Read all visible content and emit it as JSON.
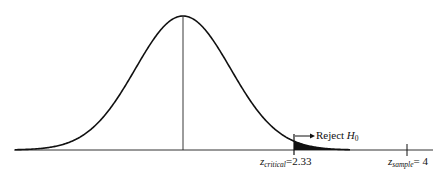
{
  "diagram": {
    "type": "normal-distribution-hypothesis-test",
    "labels": {
      "reject": "Reject",
      "reject_h": "H",
      "reject_h_sub": "0",
      "z_critical_var": "z",
      "z_critical_sub": "critical",
      "z_critical_value": "=2.33",
      "z_sample_var": "z",
      "z_sample_sub": "sample",
      "z_sample_value": "= 4"
    },
    "values": {
      "z_critical": 2.33,
      "z_sample": 4
    },
    "colors": {
      "curve": "#111111",
      "shade": "#111111",
      "axis": "#333333"
    }
  }
}
